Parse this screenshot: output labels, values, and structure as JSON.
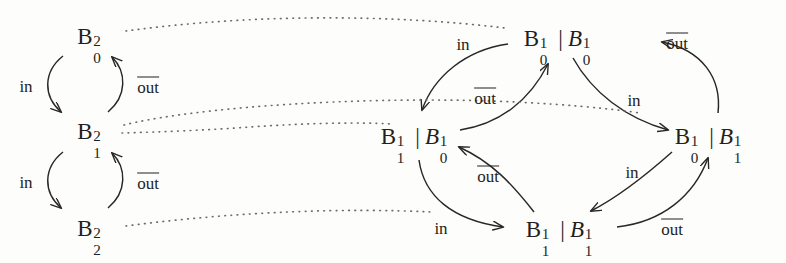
{
  "figure": {
    "kind": "commutative-diagram",
    "width": 786,
    "height": 263,
    "background": "#fdfdfc",
    "ink": "#231f20"
  },
  "left_diagram": {
    "name": "two-place-buffer-chain",
    "nodes": [
      {
        "id": "b02",
        "base": "B",
        "sup": "2",
        "sub": "0",
        "x": 92,
        "y": 36
      },
      {
        "id": "b12",
        "base": "B",
        "sup": "2",
        "sub": "1",
        "x": 92,
        "y": 131
      },
      {
        "id": "b22",
        "base": "B",
        "sup": "2",
        "sub": "2",
        "x": 92,
        "y": 228
      }
    ],
    "edges": [
      {
        "id": "b02-b12-in",
        "label": "in",
        "overline": false,
        "from": "b02",
        "to": "b12",
        "label_x": 26,
        "label_y": 86
      },
      {
        "id": "b12-b02-out",
        "label": "out",
        "overline": true,
        "from": "b12",
        "to": "b02",
        "label_x": 148,
        "label_y": 86
      },
      {
        "id": "b12-b22-in",
        "label": "in",
        "overline": false,
        "from": "b12",
        "to": "b22",
        "label_x": 26,
        "label_y": 182
      },
      {
        "id": "b22-b12-out",
        "label": "out",
        "overline": true,
        "from": "b22",
        "to": "b12",
        "label_x": 148,
        "label_y": 182
      }
    ]
  },
  "right_diagram": {
    "name": "parallel-composition-product",
    "nodes": [
      {
        "id": "n-top",
        "x": 560,
        "y": 38,
        "parts": [
          {
            "base": "B",
            "sup": "1",
            "sub": "0",
            "italic": false
          },
          {
            "base": "B",
            "sup": "1",
            "sub": "0",
            "italic": true
          }
        ],
        "separator": "|"
      },
      {
        "id": "n-left",
        "x": 417,
        "y": 136,
        "parts": [
          {
            "base": "B",
            "sup": "1",
            "sub": "1",
            "italic": false
          },
          {
            "base": "B",
            "sup": "1",
            "sub": "0",
            "italic": true
          }
        ],
        "separator": "|"
      },
      {
        "id": "n-right",
        "x": 711,
        "y": 136,
        "parts": [
          {
            "base": "B",
            "sup": "1",
            "sub": "0",
            "italic": false
          },
          {
            "base": "B",
            "sup": "1",
            "sub": "1",
            "italic": true
          }
        ],
        "separator": "|"
      },
      {
        "id": "n-bottom",
        "x": 562,
        "y": 229,
        "parts": [
          {
            "base": "B",
            "sup": "1",
            "sub": "1",
            "italic": false
          },
          {
            "base": "B",
            "sup": "1",
            "sub": "1",
            "italic": true
          }
        ],
        "separator": "|"
      }
    ],
    "edges": [
      {
        "id": "top-left-in",
        "label": "in",
        "overline": false,
        "from": "n-top",
        "to": "n-left",
        "label_x": 463,
        "label_y": 44
      },
      {
        "id": "left-top-out",
        "label": "out",
        "overline": true,
        "from": "n-left",
        "to": "n-top",
        "label_x": 485,
        "label_y": 97
      },
      {
        "id": "top-right-in",
        "label": "in",
        "overline": false,
        "from": "n-top",
        "to": "n-right",
        "label_x": 634,
        "label_y": 100
      },
      {
        "id": "right-top-out",
        "label": "out",
        "overline": true,
        "from": "n-right",
        "to": "n-top",
        "label_x": 677,
        "label_y": 42
      },
      {
        "id": "left-bottom-in",
        "label": "in",
        "overline": false,
        "from": "n-left",
        "to": "n-bottom",
        "label_x": 441,
        "label_y": 228
      },
      {
        "id": "bottom-left-out",
        "label": "out",
        "overline": true,
        "from": "n-bottom",
        "to": "n-left",
        "label_x": 488,
        "label_y": 175
      },
      {
        "id": "right-bottom-in",
        "label": "in",
        "overline": false,
        "from": "n-right",
        "to": "n-bottom",
        "label_x": 632,
        "label_y": 172
      },
      {
        "id": "bottom-right-out",
        "label": "out",
        "overline": true,
        "from": "n-bottom",
        "to": "n-right",
        "label_x": 672,
        "label_y": 228
      }
    ]
  },
  "connectors": [
    {
      "id": "c-b02-top",
      "from": "b02",
      "to": "n-top",
      "style": "dotted"
    },
    {
      "id": "c-b12-left",
      "from": "b12",
      "to": "n-left",
      "style": "dotted"
    },
    {
      "id": "c-b12-right",
      "from": "b12",
      "to": "n-right",
      "style": "dotted"
    },
    {
      "id": "c-b22-bottom",
      "from": "b22",
      "to": "n-bottom",
      "style": "dotted"
    }
  ]
}
